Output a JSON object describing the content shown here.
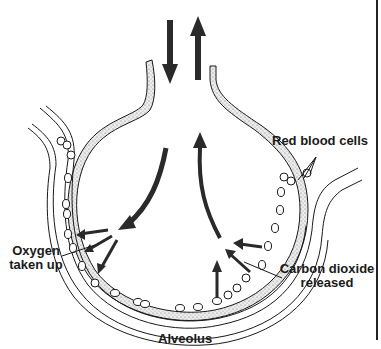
{
  "diagram": {
    "title": "Alveolus",
    "labels": {
      "red_blood_cells": "Red blood cells",
      "oxygen_line1": "Oxygen",
      "oxygen_line2": "taken up",
      "co2_line1": "Carbon dioxide",
      "co2_line2": "released"
    },
    "arrows": [
      {
        "name": "inhaled-air-arrow",
        "direction": "down"
      },
      {
        "name": "exhaled-air-arrow",
        "direction": "up"
      },
      {
        "name": "oxygen-into-alveolus-arrow",
        "direction": "down-left"
      },
      {
        "name": "co2-out-of-alveolus-arrow",
        "direction": "up"
      },
      {
        "name": "oxygen-diffusion-arrows",
        "count": 3
      },
      {
        "name": "co2-diffusion-arrows",
        "count": 3
      }
    ],
    "colors": {
      "ink": "#1a1a1a",
      "arrow": "#2a2a2a",
      "wall_stipple": "#bdbdbd",
      "background": "#ffffff"
    }
  }
}
